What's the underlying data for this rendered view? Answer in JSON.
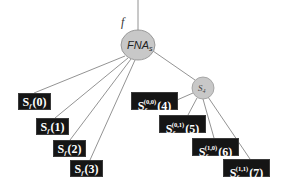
{
  "diagram": {
    "input_label": "f",
    "root": {
      "label": "FNA",
      "subscript": "s",
      "fill": "#c8c8c8",
      "stroke": "#888888"
    },
    "child": {
      "label": "S",
      "subscript": "4",
      "fill": "#c8c8c8",
      "stroke": "#999999"
    },
    "leaves_left": [
      {
        "base": "S",
        "sub": "f",
        "sup": "",
        "index": "(0)"
      },
      {
        "base": "S",
        "sub": "f",
        "sup": "",
        "index": "(1)"
      },
      {
        "base": "S",
        "sub": "f",
        "sup": "",
        "index": "(2)"
      },
      {
        "base": "S",
        "sub": "f",
        "sup": "",
        "index": "(3)"
      }
    ],
    "leaves_right": [
      {
        "base": "S",
        "sub": "f",
        "sup": "(0,0)",
        "index": "(4)"
      },
      {
        "base": "S",
        "sub": "f",
        "sup": "(0,1)",
        "index": "(5)"
      },
      {
        "base": "S",
        "sub": "f",
        "sup": "(1,0)",
        "index": "(6)"
      },
      {
        "base": "S",
        "sub": "f",
        "sup": "(1,1)",
        "index": "(7)"
      }
    ],
    "colors": {
      "edge": "#777777",
      "box_bg": "#151515",
      "box_text": "#ffffff"
    }
  }
}
